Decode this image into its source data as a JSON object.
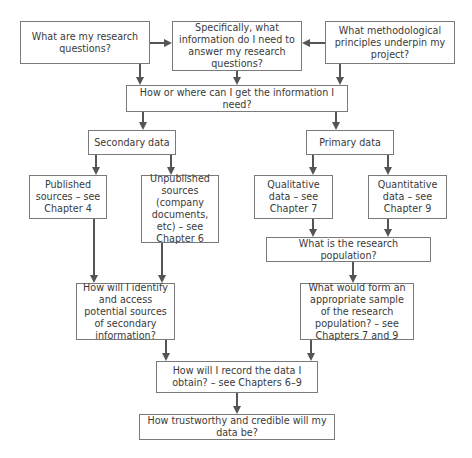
{
  "diagram": {
    "type": "flowchart",
    "nodes": {
      "research_questions": "What are my research questions?",
      "specific_information": "Specifically, what information do I need to answer my research questions?",
      "methodological_principles": "What methodological principles underpin my project?",
      "how_where": "How or where can I get the information I need?",
      "secondary_data": "Secondary data",
      "primary_data": "Primary data",
      "published_sources": "Published sources – see Chapter 4",
      "unpublished_sources": "Unpublished sources (company documents, etc) – see Chapter 6",
      "qualitative_data": "Qualitative data – see Chapter 7",
      "quantitative_data": "Quantitative data – see Chapter 9",
      "research_population": "What is the research population?",
      "identify_access": "How will I identify and access potential sources of secondary information?",
      "appropriate_sample": "What would form an appropriate sample of the research population? – see Chapters 7 and 9",
      "record_data": "How will I record the data I obtain? – see Chapters 6–9",
      "trustworthy": "How trustworthy and credible will my data be?"
    },
    "edges": [
      [
        "research_questions",
        "specific_information"
      ],
      [
        "methodological_principles",
        "specific_information"
      ],
      [
        "research_questions",
        "how_where"
      ],
      [
        "specific_information",
        "how_where"
      ],
      [
        "methodological_principles",
        "how_where"
      ],
      [
        "how_where",
        "secondary_data"
      ],
      [
        "how_where",
        "primary_data"
      ],
      [
        "secondary_data",
        "published_sources"
      ],
      [
        "secondary_data",
        "unpublished_sources"
      ],
      [
        "primary_data",
        "qualitative_data"
      ],
      [
        "primary_data",
        "quantitative_data"
      ],
      [
        "qualitative_data",
        "research_population"
      ],
      [
        "quantitative_data",
        "research_population"
      ],
      [
        "published_sources",
        "identify_access"
      ],
      [
        "unpublished_sources",
        "identify_access"
      ],
      [
        "research_population",
        "appropriate_sample"
      ],
      [
        "identify_access",
        "record_data"
      ],
      [
        "appropriate_sample",
        "record_data"
      ],
      [
        "record_data",
        "trustworthy"
      ]
    ],
    "colors": {
      "line": "#555555",
      "border": "#7a7a7a",
      "text": "#3a3a3a",
      "background": "#ffffff"
    }
  }
}
